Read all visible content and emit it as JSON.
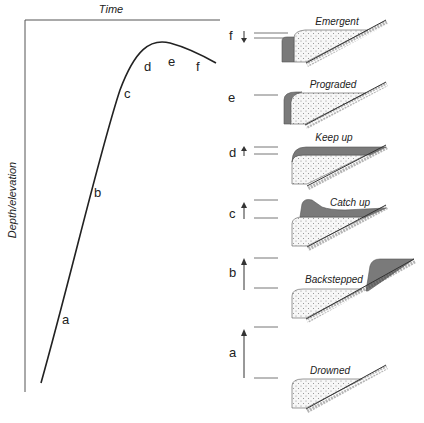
{
  "diagram": {
    "type": "carbonate platform response to relative sea-level change",
    "axes": {
      "x_label": "Time",
      "y_label": "Depth/elevation"
    },
    "curve_points": [
      "a",
      "b",
      "c",
      "d",
      "e",
      "f"
    ],
    "colors": {
      "line": "#222222",
      "axis": "#555555",
      "sediment_fill": "#f4f4f4",
      "stipple": "#8a8a8a",
      "carbonate_fill": "#7a7a7a",
      "sea_level": "#777777"
    },
    "panels": [
      {
        "key": "f",
        "label": "Emergent",
        "sea_level_trend": "falling"
      },
      {
        "key": "e",
        "label": "Prograded",
        "sea_level_trend": "stable"
      },
      {
        "key": "d",
        "label": "Keep up",
        "sea_level_trend": "slow rise"
      },
      {
        "key": "c",
        "label": "Catch up",
        "sea_level_trend": "moderate rise"
      },
      {
        "key": "b",
        "label": "Backstepped",
        "sea_level_trend": "rapid rise"
      },
      {
        "key": "a",
        "label": "Drowned",
        "sea_level_trend": "very rapid rise"
      }
    ]
  }
}
